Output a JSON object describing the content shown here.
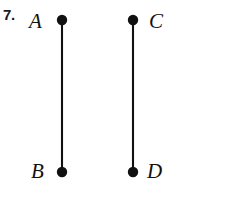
{
  "problem": {
    "number_label": "7."
  },
  "figure": {
    "stroke_color": "#111111",
    "background_color": "#ffffff",
    "segments": [
      {
        "name": "segment-ab",
        "x": 62,
        "y_top": 20,
        "y_bottom": 172,
        "top_point": "A",
        "bottom_point": "B"
      },
      {
        "name": "segment-cd",
        "x": 133,
        "y_top": 20,
        "y_bottom": 172,
        "top_point": "C",
        "bottom_point": "D"
      }
    ],
    "points": [
      {
        "label": "A",
        "cx": 62,
        "cy": 20,
        "r": 5.2,
        "label_side": "left"
      },
      {
        "label": "B",
        "cx": 62,
        "cy": 172,
        "r": 5.2,
        "label_side": "left"
      },
      {
        "label": "C",
        "cx": 133,
        "cy": 20,
        "r": 5.2,
        "label_side": "right"
      },
      {
        "label": "D",
        "cx": 133,
        "cy": 172,
        "r": 5.2,
        "label_side": "right"
      }
    ],
    "labels": {
      "a": "A",
      "b": "B",
      "c": "C",
      "d": "D"
    }
  }
}
